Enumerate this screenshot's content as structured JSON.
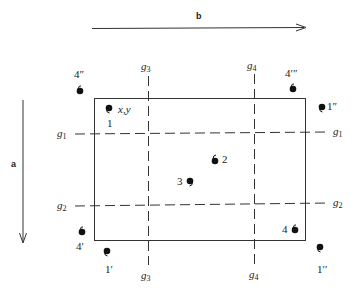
{
  "diagram": {
    "arrows": {
      "b": {
        "label": "b",
        "direction": "right"
      },
      "a": {
        "label": "a",
        "direction": "down"
      }
    },
    "grid_lines": {
      "g1": {
        "name": "g",
        "sub": "1",
        "orientation": "horizontal"
      },
      "g2": {
        "name": "g",
        "sub": "2",
        "orientation": "horizontal"
      },
      "g3": {
        "name": "g",
        "sub": "3",
        "orientation": "vertical"
      },
      "g4": {
        "name": "g",
        "sub": "4",
        "orientation": "vertical"
      }
    },
    "points": [
      {
        "id": "p1",
        "label": "1",
        "coord_label": "x,y",
        "x": 108,
        "y": 108
      },
      {
        "id": "p2",
        "label": "2",
        "x": 215,
        "y": 160
      },
      {
        "id": "p3",
        "label": "3",
        "x": 189,
        "y": 181
      },
      {
        "id": "p4",
        "label": "4",
        "x": 295,
        "y": 230
      },
      {
        "id": "p4p",
        "label": "4′",
        "x": 82,
        "y": 232
      },
      {
        "id": "p1p",
        "label": "1′",
        "x": 108,
        "y": 252
      },
      {
        "id": "p1pp_bottom",
        "label": "1′′",
        "x": 320,
        "y": 248
      },
      {
        "id": "p4pp",
        "label": "4″",
        "x": 80,
        "y": 90
      },
      {
        "id": "p4ppp",
        "label": "4′″",
        "x": 293,
        "y": 88
      },
      {
        "id": "p1pp_top",
        "label": "1″",
        "x": 322,
        "y": 107
      }
    ],
    "colors": {
      "ink": "#222222",
      "background": "#ffffff"
    }
  }
}
